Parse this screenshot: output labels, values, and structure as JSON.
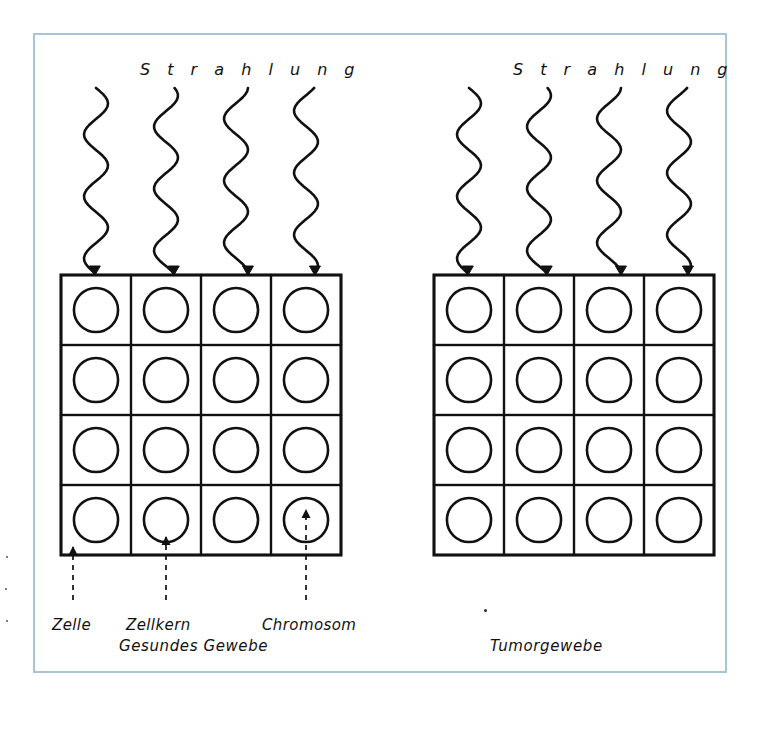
{
  "figure": {
    "title_left": "S t r a h l u n g",
    "title_right": "S t r a h l u n g",
    "caption_left": "Gesundes Gewebe",
    "caption_right": "Tumorgewebe",
    "frame_color": "#a6c6d8",
    "ink_color": "#111111",
    "background": "#ffffff"
  },
  "callouts": [
    {
      "label": "Zelle",
      "x": 52,
      "y": 616
    },
    {
      "label": "Zellkern",
      "x": 126,
      "y": 616
    },
    {
      "label": "Chromosom",
      "x": 262,
      "y": 616
    }
  ],
  "panels": [
    {
      "name": "healthy",
      "caption": "Gesundes Gewebe",
      "heading": "S t r a h l u n g",
      "grid": {
        "x": 61,
        "y": 275,
        "cols": 4,
        "rows": 4,
        "cell": 70
      },
      "rays": 4,
      "cells": [
        [
          1,
          2,
          1,
          2
        ],
        [
          1,
          1,
          1,
          1
        ],
        [
          2,
          1,
          2,
          1
        ],
        [
          1,
          1,
          1,
          1
        ]
      ]
    },
    {
      "name": "tumor",
      "caption": "Tumorgewebe",
      "heading": "S t r a h l u n g",
      "grid": {
        "x": 434,
        "y": 275,
        "cols": 4,
        "rows": 4,
        "cell": 70
      },
      "rays": 4,
      "cells": [
        [
          2,
          2,
          2,
          1
        ],
        [
          1,
          2,
          2,
          2
        ],
        [
          2,
          2,
          1,
          2
        ],
        [
          2,
          1,
          2,
          2
        ]
      ]
    }
  ],
  "chart_data": {
    "type": "diagram",
    "annotations": [
      "Zelle",
      "Zellkern",
      "Chromosom"
    ],
    "groups": [
      "Gesundes Gewebe",
      "Tumorgewebe"
    ],
    "rays_per_group": 4,
    "cells_per_group": 16
  }
}
